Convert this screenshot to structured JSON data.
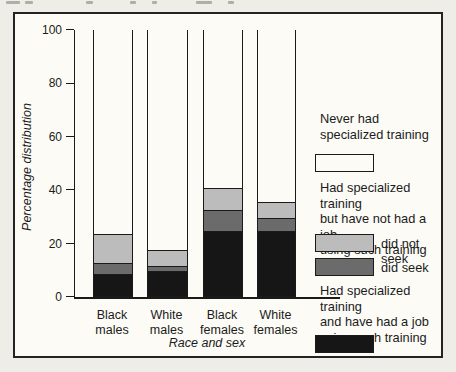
{
  "chart_data": {
    "type": "bar",
    "stacked": true,
    "categories": [
      "Black males",
      "White males",
      "Black females",
      "White females"
    ],
    "series": [
      {
        "name": "Had specialized training and have had a job using such training",
        "color": "#161616",
        "values": [
          8,
          9,
          24,
          24
        ]
      },
      {
        "name": "did seek",
        "color": "#6b6b6b",
        "values": [
          4,
          2,
          8,
          5
        ]
      },
      {
        "name": "did not seek",
        "color": "#bcbcbc",
        "values": [
          11,
          6,
          8,
          6
        ]
      },
      {
        "name": "Never had specialized training",
        "color": "#fcfbf6",
        "values": [
          77,
          83,
          60,
          65
        ]
      }
    ],
    "title": "",
    "xlabel": "Race and sex",
    "ylabel": "Percentage distribution",
    "ylim": [
      0,
      100
    ],
    "y_ticks": [
      100,
      80,
      60,
      40,
      20,
      0
    ],
    "legend_position": "right"
  },
  "legend": {
    "never_lines": [
      "Never had",
      "specialized training"
    ],
    "no_job_lines": [
      "Had specialized training",
      "but have not had a job",
      "using such training and"
    ],
    "did_not_seek_label": "did not seek",
    "did_seek_label": "did seek",
    "had_job_lines": [
      "Had specialized training",
      "and have had a job",
      "using such training"
    ]
  }
}
